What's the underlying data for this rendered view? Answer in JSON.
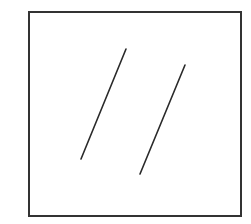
{
  "diagram": {
    "colors": {
      "background": "#ffffff",
      "stroke": "#2a2a2a",
      "frame": "#333333"
    },
    "frame": {
      "x": 29,
      "y": 12,
      "width": 212,
      "height": 204,
      "stroke_width": 2
    },
    "lines": [
      {
        "id": "line-1",
        "x1": 126,
        "y1": 49,
        "x2": 81,
        "y2": 159,
        "stroke_width": 1.6
      },
      {
        "id": "line-2",
        "x1": 185,
        "y1": 65,
        "x2": 140,
        "y2": 174,
        "stroke_width": 1.6
      }
    ]
  }
}
